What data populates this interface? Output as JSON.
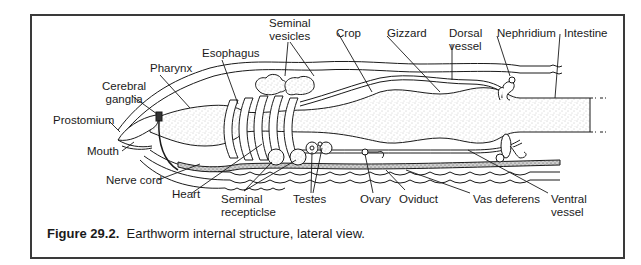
{
  "figure": {
    "caption_number": "Figure 29.2.",
    "caption_text": "Earthworm internal structure, lateral view.",
    "subject": "Earthworm",
    "view": "lateral"
  },
  "labels": {
    "top": [
      {
        "id": "pharynx",
        "text": "Pharynx"
      },
      {
        "id": "esophagus",
        "text": "Esophagus"
      },
      {
        "id": "seminal-vesicles",
        "line1": "Seminal",
        "line2": "vesicles"
      },
      {
        "id": "crop",
        "text": "Crop"
      },
      {
        "id": "gizzard",
        "text": "Gizzard"
      },
      {
        "id": "dorsal-vessel",
        "line1": "Dorsal",
        "line2": "vessel"
      },
      {
        "id": "nephridium",
        "text": "Nephridium"
      },
      {
        "id": "intestine",
        "text": "Intestine"
      }
    ],
    "left": [
      {
        "id": "cerebral-ganglia",
        "line1": "Cerebral",
        "line2": "ganglia"
      },
      {
        "id": "prostomium",
        "text": "Prostomium"
      },
      {
        "id": "mouth",
        "text": "Mouth"
      },
      {
        "id": "nerve-cord",
        "text": "Nerve cord"
      }
    ],
    "bottom": [
      {
        "id": "heart",
        "text": "Heart"
      },
      {
        "id": "seminal-recepticlse",
        "line1": "Seminal",
        "line2": "recepticlse"
      },
      {
        "id": "testes",
        "text": "Testes"
      },
      {
        "id": "ovary",
        "text": "Ovary"
      },
      {
        "id": "oviduct",
        "text": "Oviduct"
      },
      {
        "id": "vas-deferens",
        "text": "Vas deferens"
      },
      {
        "id": "ventral-vessel",
        "line1": "Ventral",
        "line2": "vessel"
      }
    ]
  },
  "colors": {
    "frame": "#3a3a3a",
    "line": "#1a1a1a",
    "text": "#1a1a1a",
    "stipple": "#9a9a9a"
  }
}
